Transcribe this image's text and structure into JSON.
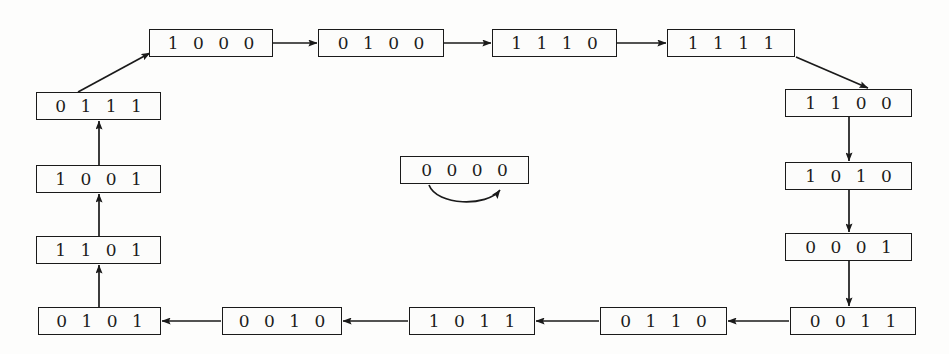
{
  "diagram": {
    "type": "directed-graph",
    "background_color": "#fdfdfc",
    "node_border_color": "#1a1a1a",
    "node_fill_color": "#fcfcfb",
    "edge_color": "#1a1a1a",
    "nodes": [
      {
        "id": "n1000",
        "label": "1 0 0 0",
        "x": 149,
        "y": 29,
        "w": 124,
        "h": 28
      },
      {
        "id": "n0100",
        "label": "0 1 0 0",
        "x": 318,
        "y": 29,
        "w": 126,
        "h": 28
      },
      {
        "id": "n1110",
        "label": "1 1 1 0",
        "x": 492,
        "y": 29,
        "w": 125,
        "h": 28
      },
      {
        "id": "n1111",
        "label": "1 1 1 1",
        "x": 667,
        "y": 29,
        "w": 128,
        "h": 28
      },
      {
        "id": "n0111",
        "label": "0 1 1 1",
        "x": 36,
        "y": 92,
        "w": 125,
        "h": 28
      },
      {
        "id": "n1001",
        "label": "1 0 0 1",
        "x": 36,
        "y": 165,
        "w": 125,
        "h": 28
      },
      {
        "id": "n1101",
        "label": "1 1 0 1",
        "x": 36,
        "y": 236,
        "w": 125,
        "h": 28
      },
      {
        "id": "n0101",
        "label": "0 1 0 1",
        "x": 38,
        "y": 307,
        "w": 123,
        "h": 28
      },
      {
        "id": "n1100",
        "label": "1 1 0 0",
        "x": 785,
        "y": 89,
        "w": 127,
        "h": 28
      },
      {
        "id": "n1010",
        "label": "1 0 1 0",
        "x": 785,
        "y": 162,
        "w": 127,
        "h": 28
      },
      {
        "id": "n0001",
        "label": "0 0 0 1",
        "x": 785,
        "y": 233,
        "w": 127,
        "h": 28
      },
      {
        "id": "n0011",
        "label": "0 0 1 1",
        "x": 790,
        "y": 307,
        "w": 126,
        "h": 28
      },
      {
        "id": "n0110",
        "label": "0 1 1 0",
        "x": 600,
        "y": 307,
        "w": 127,
        "h": 28
      },
      {
        "id": "n1011",
        "label": "1 0 1 1",
        "x": 409,
        "y": 307,
        "w": 126,
        "h": 28
      },
      {
        "id": "n0010",
        "label": "0 0 1 0",
        "x": 222,
        "y": 307,
        "w": 120,
        "h": 28
      },
      {
        "id": "n0000",
        "label": "0 0 0 0",
        "x": 400,
        "y": 156,
        "w": 129,
        "h": 28
      }
    ],
    "edges": [
      {
        "id": "e-0111-1000",
        "from": "0111",
        "to": "1000",
        "kind": "diagonal"
      },
      {
        "id": "e-1000-0100",
        "from": "1000",
        "to": "0100",
        "kind": "horizontal"
      },
      {
        "id": "e-0100-1110",
        "from": "0100",
        "to": "1110",
        "kind": "horizontal"
      },
      {
        "id": "e-1110-1111",
        "from": "1110",
        "to": "1111",
        "kind": "horizontal"
      },
      {
        "id": "e-1111-1100",
        "from": "1111",
        "to": "1100",
        "kind": "diagonal"
      },
      {
        "id": "e-1100-1010",
        "from": "1100",
        "to": "1010",
        "kind": "vertical-down"
      },
      {
        "id": "e-1010-0001",
        "from": "1010",
        "to": "0001",
        "kind": "vertical-down"
      },
      {
        "id": "e-0001-0011",
        "from": "0001",
        "to": "0011",
        "kind": "vertical-down"
      },
      {
        "id": "e-0011-0110",
        "from": "0011",
        "to": "0110",
        "kind": "horizontal-left"
      },
      {
        "id": "e-0110-1011",
        "from": "0110",
        "to": "1011",
        "kind": "horizontal-left"
      },
      {
        "id": "e-1011-0010",
        "from": "1011",
        "to": "0010",
        "kind": "horizontal-left"
      },
      {
        "id": "e-0010-0101",
        "from": "0010",
        "to": "0101",
        "kind": "horizontal-left"
      },
      {
        "id": "e-0101-1101",
        "from": "0101",
        "to": "1101",
        "kind": "vertical-up"
      },
      {
        "id": "e-1101-1001",
        "from": "1101",
        "to": "1001",
        "kind": "vertical-up"
      },
      {
        "id": "e-1001-0111",
        "from": "1001",
        "to": "0111",
        "kind": "vertical-up"
      },
      {
        "id": "e-0000-0000",
        "from": "0000",
        "to": "0000",
        "kind": "self-loop"
      }
    ]
  }
}
